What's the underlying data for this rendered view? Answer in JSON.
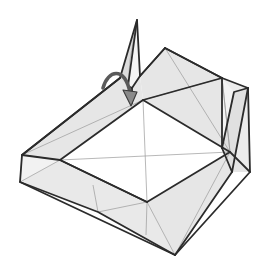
{
  "figure": {
    "kind": "origami-folding-diagram",
    "title": "Origami fold step diagram",
    "description": "Three-dimensional origami model shown in perspective: an open box-like form with a flat square central panel, four shaded sloping side walls, a tall narrow pointed flap standing up at the top, a second narrow flap standing at the right, and a curved action arrow indicating the top flap folds down and to the right.",
    "canvas": {
      "width": 270,
      "height": 272,
      "background": "#ffffff"
    },
    "style": {
      "paper_front": "#ffffff",
      "paper_back_shaded": "#e3e3e3",
      "paper_back_shaded_alt": "#ededed",
      "edge_color": "#2b2b2b",
      "crease_color": "#9a9a9a",
      "arrow_fill": "#8a8a8a",
      "arrow_stroke": "#3a3a3a",
      "edge_width": 1.8,
      "crease_width": 0.7
    },
    "annotations": {
      "arrow": {
        "name": "fold-arrow",
        "kind": "curved-valley-fold-arrow",
        "meaning": "fold the standing top flap down toward the lower right",
        "start": [
          103,
          88
        ],
        "control": [
          118,
          70
        ],
        "end": [
          131,
          97
        ],
        "head_tip": [
          133,
          104
        ],
        "direction": "clockwise-down-right"
      }
    },
    "vertices": {
      "flap_top_apex": [
        137,
        20
      ],
      "flap_top_left_base": [
        120,
        78
      ],
      "flap_top_right_base": [
        140,
        76
      ],
      "flap_top_notch": [
        132,
        88
      ],
      "ridge_top_right": [
        165,
        48
      ],
      "outer_right_upper": [
        222,
        78
      ],
      "flap_right_apex": [
        248,
        88
      ],
      "flap_right_base": [
        232,
        172
      ],
      "outer_right_lower": [
        250,
        172
      ],
      "outer_left_upper": [
        22,
        155
      ],
      "outer_left_lower": [
        20,
        182
      ],
      "outer_bottom": [
        175,
        255
      ],
      "outer_bottom_left": [
        98,
        212
      ],
      "inner_top": [
        143,
        100
      ],
      "inner_left": [
        60,
        160
      ],
      "inner_right": [
        230,
        152
      ],
      "inner_bottom": [
        147,
        202
      ],
      "center": [
        145,
        151
      ]
    },
    "panels": [
      {
        "name": "top-standing-flap",
        "shade": "light",
        "interactable": false
      },
      {
        "name": "right-standing-flap",
        "shade": "light",
        "interactable": false
      },
      {
        "name": "upper-right-wall",
        "shade": "shaded",
        "interactable": false
      },
      {
        "name": "upper-left-wall",
        "shade": "shaded",
        "interactable": false
      },
      {
        "name": "lower-left-wall",
        "shade": "shaded",
        "interactable": false
      },
      {
        "name": "lower-right-wall",
        "shade": "shaded",
        "interactable": false
      },
      {
        "name": "central-square-panel",
        "shade": "white",
        "interactable": false
      }
    ]
  }
}
